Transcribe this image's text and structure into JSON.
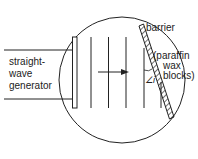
{
  "diagram": {
    "type": "ripple-tank-reflection",
    "labels": {
      "generator_line1": "straight-",
      "generator_line2": "wave",
      "generator_line3": "generator",
      "barrier": "barrier",
      "barrier_material_line1": "(paraffin",
      "barrier_material_line2": "wax",
      "barrier_material_line3": "blocks)",
      "angle": "∠i"
    },
    "colors": {
      "ink": "#222222",
      "background": "#ffffff"
    },
    "wavefront_count": 5
  }
}
